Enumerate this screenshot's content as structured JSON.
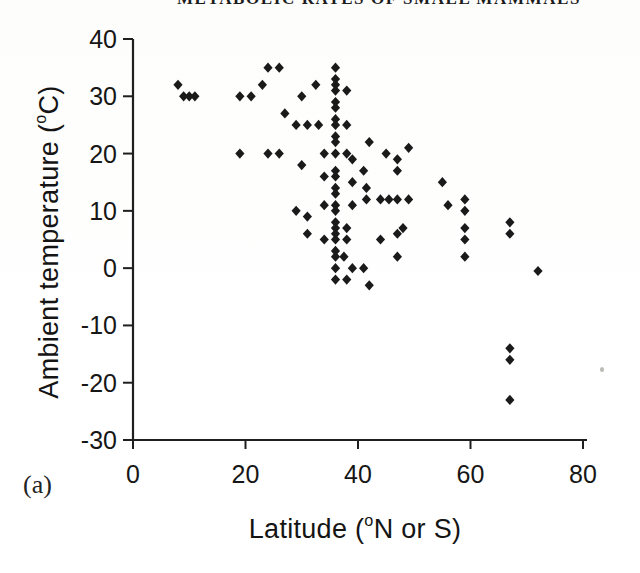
{
  "page": {
    "running_head": "METABOLIC RATES OF SMALL MAMMALS",
    "panel_label": "(a)"
  },
  "chart_data": {
    "type": "scatter",
    "title": "",
    "xlabel": {
      "pre": "Latitude (",
      "sup": "o",
      "post": "N or S)"
    },
    "ylabel": {
      "pre": "Ambient temperature (",
      "sup": "o",
      "post": "C)"
    },
    "xlim": [
      0,
      80
    ],
    "ylim": [
      -30,
      40
    ],
    "x_ticks": [
      0,
      20,
      40,
      60,
      80
    ],
    "y_ticks": [
      40,
      30,
      20,
      10,
      0,
      -10,
      -20,
      -30
    ],
    "grid": false,
    "legend": "none",
    "marker": "filled-diamond",
    "marker_color": "#1a1a1a",
    "axis_color": "#1f1f1f",
    "points": [
      [
        8,
        32
      ],
      [
        9,
        30
      ],
      [
        10,
        30
      ],
      [
        11,
        30
      ],
      [
        19,
        30
      ],
      [
        21,
        30
      ],
      [
        23,
        32
      ],
      [
        24,
        35
      ],
      [
        26,
        35
      ],
      [
        27,
        27
      ],
      [
        29,
        25
      ],
      [
        30,
        30
      ],
      [
        31,
        25
      ],
      [
        32.5,
        32
      ],
      [
        33,
        25
      ],
      [
        19,
        20
      ],
      [
        24,
        20
      ],
      [
        26,
        20
      ],
      [
        30,
        18
      ],
      [
        36,
        35
      ],
      [
        36,
        33
      ],
      [
        36,
        32
      ],
      [
        36,
        31
      ],
      [
        36,
        29
      ],
      [
        36,
        28
      ],
      [
        36,
        26
      ],
      [
        36,
        25
      ],
      [
        36,
        23
      ],
      [
        36,
        22
      ],
      [
        36,
        20
      ],
      [
        38,
        31
      ],
      [
        38,
        25
      ],
      [
        34,
        20
      ],
      [
        38,
        20
      ],
      [
        39,
        19
      ],
      [
        36,
        17
      ],
      [
        36,
        16
      ],
      [
        36,
        14
      ],
      [
        36,
        13
      ],
      [
        36,
        11
      ],
      [
        36,
        10
      ],
      [
        36,
        8
      ],
      [
        36,
        7
      ],
      [
        36,
        6
      ],
      [
        36,
        5
      ],
      [
        36,
        3
      ],
      [
        34,
        16
      ],
      [
        39,
        15
      ],
      [
        34,
        11
      ],
      [
        39,
        11
      ],
      [
        38,
        7
      ],
      [
        34,
        5
      ],
      [
        38,
        5
      ],
      [
        36,
        2
      ],
      [
        37.5,
        2
      ],
      [
        36,
        0
      ],
      [
        36,
        -2
      ],
      [
        38,
        -2
      ],
      [
        29,
        10
      ],
      [
        31,
        9
      ],
      [
        31,
        6
      ],
      [
        42,
        22
      ],
      [
        45,
        20
      ],
      [
        49,
        21
      ],
      [
        47,
        19
      ],
      [
        47,
        17
      ],
      [
        41,
        17
      ],
      [
        41.5,
        14
      ],
      [
        41.5,
        12
      ],
      [
        44,
        12
      ],
      [
        45.5,
        12
      ],
      [
        47,
        12
      ],
      [
        49,
        12
      ],
      [
        48,
        7
      ],
      [
        47,
        6
      ],
      [
        44,
        5
      ],
      [
        47,
        2
      ],
      [
        42,
        -3
      ],
      [
        39,
        0
      ],
      [
        41,
        0
      ],
      [
        55,
        15
      ],
      [
        56,
        11
      ],
      [
        59,
        12
      ],
      [
        59,
        10
      ],
      [
        59,
        7
      ],
      [
        59,
        5
      ],
      [
        59,
        2
      ],
      [
        67,
        8
      ],
      [
        67,
        6
      ],
      [
        67,
        -14
      ],
      [
        67,
        -16
      ],
      [
        67,
        -23
      ],
      [
        72,
        -0.5
      ]
    ]
  }
}
